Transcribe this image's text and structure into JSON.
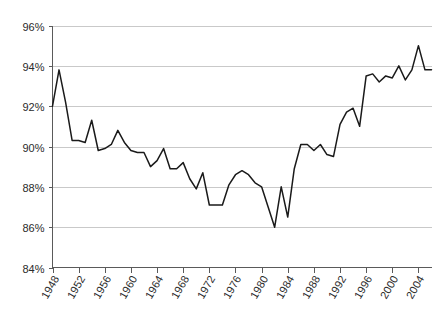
{
  "chart_data": {
    "type": "line",
    "title": "",
    "xlabel": "",
    "ylabel": "",
    "xlim": [
      1948,
      2006
    ],
    "ylim": [
      84,
      96
    ],
    "grid": true,
    "legend_position": "none",
    "y_tick_labels": [
      "96%",
      "94%",
      "92%",
      "90%",
      "88%",
      "86%",
      "84%"
    ],
    "y_tick_values": [
      96,
      94,
      92,
      90,
      88,
      86,
      84
    ],
    "x_tick_labels": [
      "1948",
      "1952",
      "1956",
      "1960",
      "1964",
      "1968",
      "1972",
      "1976",
      "1980",
      "1984",
      "1988",
      "1992",
      "1996",
      "2000",
      "2004"
    ],
    "x_tick_values": [
      1948,
      1952,
      1956,
      1960,
      1964,
      1968,
      1972,
      1976,
      1980,
      1984,
      1988,
      1992,
      1996,
      2000,
      2004
    ],
    "series": [
      {
        "name": "value",
        "color": "#1a1a1a",
        "x": [
          1948,
          1949,
          1950,
          1951,
          1952,
          1953,
          1954,
          1955,
          1956,
          1957,
          1958,
          1959,
          1960,
          1961,
          1962,
          1963,
          1964,
          1965,
          1966,
          1967,
          1968,
          1969,
          1970,
          1971,
          1972,
          1973,
          1974,
          1975,
          1976,
          1977,
          1978,
          1979,
          1980,
          1981,
          1982,
          1983,
          1984,
          1985,
          1986,
          1987,
          1988,
          1989,
          1990,
          1991,
          1992,
          1993,
          1994,
          1995,
          1996,
          1997,
          1998,
          1999,
          2000,
          2001,
          2002,
          2003,
          2004,
          2005,
          2006
        ],
        "values": [
          92.0,
          93.8,
          92.2,
          90.3,
          90.3,
          90.2,
          91.3,
          89.8,
          89.9,
          90.1,
          90.8,
          90.2,
          89.8,
          89.7,
          89.7,
          89.0,
          89.3,
          89.9,
          88.9,
          88.9,
          89.2,
          88.4,
          87.9,
          88.7,
          87.1,
          87.1,
          87.1,
          88.1,
          88.6,
          88.8,
          88.6,
          88.2,
          88.0,
          87.0,
          86.0,
          88.0,
          86.5,
          88.9,
          90.1,
          90.1,
          89.8,
          90.1,
          89.6,
          89.5,
          91.1,
          91.7,
          91.9,
          91.0,
          93.5,
          93.6,
          93.2,
          93.5,
          93.4,
          94.0,
          93.3,
          93.8,
          95.0,
          93.8,
          93.8
        ]
      }
    ]
  }
}
